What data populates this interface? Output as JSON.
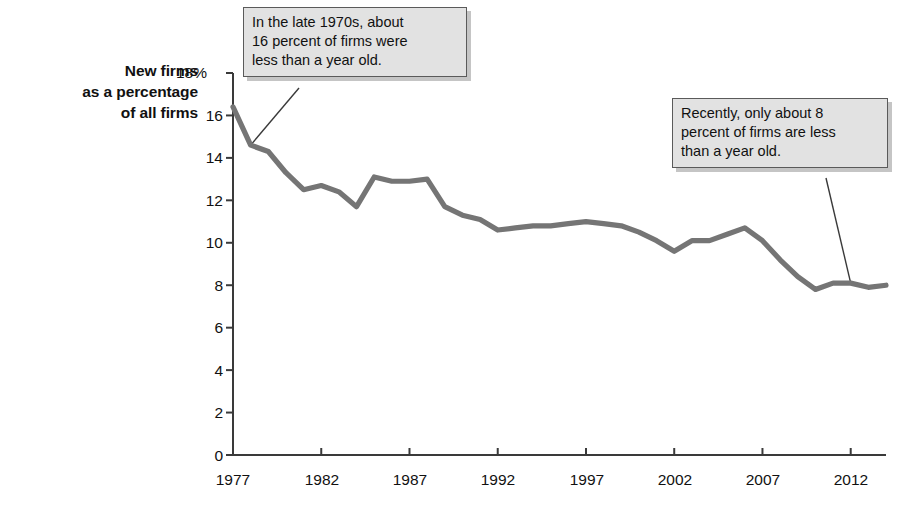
{
  "chart_data": {
    "type": "line",
    "title": "",
    "ylabel": "New firms as a percentage of all firms",
    "xlabel": "",
    "ylim": [
      0,
      18
    ],
    "xlim": [
      1977,
      2014
    ],
    "grid": false,
    "legend": "none",
    "y_tick_labels": [
      "18%",
      "16",
      "14",
      "12",
      "10",
      "8",
      "6",
      "4",
      "2",
      "0"
    ],
    "y_ticks": [
      18,
      16,
      14,
      12,
      10,
      8,
      6,
      4,
      2,
      0
    ],
    "x_tick_labels": [
      "1977",
      "1982",
      "1987",
      "1992",
      "1997",
      "2002",
      "2007",
      "2012"
    ],
    "x_ticks": [
      1977,
      1982,
      1987,
      1992,
      1997,
      2002,
      2007,
      2012
    ],
    "series": [
      {
        "name": "New firms as a percentage of all firms",
        "color": "#757575",
        "x": [
          1977,
          1978,
          1979,
          1980,
          1981,
          1982,
          1983,
          1984,
          1985,
          1986,
          1987,
          1988,
          1989,
          1990,
          1991,
          1992,
          1993,
          1994,
          1995,
          1996,
          1997,
          1998,
          1999,
          2000,
          2001,
          2002,
          2003,
          2004,
          2005,
          2006,
          2007,
          2008,
          2009,
          2010,
          2011,
          2012,
          2013,
          2014
        ],
        "values": [
          16.4,
          14.6,
          14.3,
          13.3,
          12.5,
          12.7,
          12.4,
          11.7,
          13.1,
          12.9,
          12.9,
          13.0,
          11.7,
          11.3,
          11.1,
          10.6,
          10.7,
          10.8,
          10.8,
          10.9,
          11.0,
          10.9,
          10.8,
          10.5,
          10.1,
          9.6,
          10.1,
          10.1,
          10.4,
          10.7,
          10.1,
          9.2,
          8.4,
          7.8,
          8.1,
          8.1,
          7.9,
          8.0
        ]
      }
    ],
    "annotations": [
      {
        "id": "callout-1",
        "lines": [
          "In the late 1970s, about",
          "16 percent of firms were",
          "less than a year old."
        ],
        "points_to_year": 1978,
        "points_to_value": 14.6
      },
      {
        "id": "callout-2",
        "lines": [
          "Recently, only about 8",
          "percent of firms are less",
          "than a year old."
        ],
        "points_to_year": 2012,
        "points_to_value": 8.1
      }
    ]
  },
  "axis_title": {
    "line1": "New firms",
    "line2": "as a percentage",
    "line3": "of all firms"
  },
  "colors": {
    "line": "#757575",
    "axis": "#3a3a3a",
    "callout_fill": "#e2e2e2",
    "callout_border": "#5a5a5a",
    "text": "#111111"
  }
}
